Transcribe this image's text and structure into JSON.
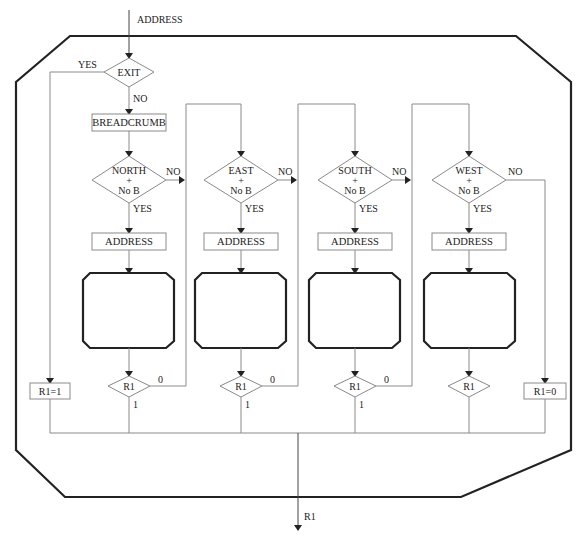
{
  "diagram": {
    "type": "flowchart",
    "input_label": "ADDRESS",
    "output_label": "R1",
    "exit_decision": {
      "label": "EXIT",
      "yes": "YES",
      "no": "NO"
    },
    "breadcrumb_box": "BREADCRUMB",
    "r1_set_1": "R1=1",
    "r1_set_0": "R1=0",
    "columns": [
      {
        "direction": "NORTH",
        "plus": "+",
        "cond": "No B",
        "yes": "YES",
        "no": "NO",
        "address": "ADDRESS",
        "check": "R1",
        "zero": "0",
        "one": "1"
      },
      {
        "direction": "EAST",
        "plus": "+",
        "cond": "No B",
        "yes": "YES",
        "no": "NO",
        "address": "ADDRESS",
        "check": "R1",
        "zero": "0",
        "one": "1"
      },
      {
        "direction": "SOUTH",
        "plus": "+",
        "cond": "No B",
        "yes": "YES",
        "no": "NO",
        "address": "ADDRESS",
        "check": "R1",
        "zero": "0",
        "one": "1"
      },
      {
        "direction": "WEST",
        "plus": "+",
        "cond": "No B",
        "yes": "YES",
        "no": "NO",
        "address": "ADDRESS",
        "check": "R1"
      }
    ]
  }
}
